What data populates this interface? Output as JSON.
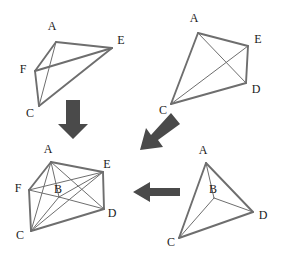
{
  "figure": {
    "line_color": "#6e6e6e",
    "arrow_color": "#4a4a4a",
    "label_color": "#1a1a1a",
    "background_color": "#ffffff"
  },
  "panels": [
    {
      "id": "top-left",
      "name": "upper-left-polyhedron",
      "vertices": [
        {
          "label": "A",
          "x": 56,
          "y": 42,
          "lx": 52,
          "ly": 27
        },
        {
          "label": "E",
          "x": 112,
          "y": 48,
          "lx": 121,
          "ly": 41
        },
        {
          "label": "F",
          "x": 35,
          "y": 71,
          "lx": 23,
          "ly": 70
        },
        {
          "label": "C",
          "x": 39,
          "y": 106,
          "lx": 30,
          "ly": 114
        }
      ],
      "edges": [
        {
          "from": "A",
          "to": "E",
          "weight": "thick"
        },
        {
          "from": "A",
          "to": "F",
          "weight": "thick"
        },
        {
          "from": "A",
          "to": "C",
          "weight": "thin"
        },
        {
          "from": "F",
          "to": "C",
          "weight": "thick"
        },
        {
          "from": "F",
          "to": "E",
          "weight": "thick"
        },
        {
          "from": "C",
          "to": "E",
          "weight": "thick"
        },
        {
          "from": "A",
          "to": "D",
          "weight": "thin"
        }
      ]
    },
    {
      "id": "top-right",
      "name": "upper-right-polyhedron",
      "vertices": [
        {
          "label": "A",
          "x": 198,
          "y": 33,
          "lx": 194,
          "ly": 19
        },
        {
          "label": "E",
          "x": 248,
          "y": 46,
          "lx": 258,
          "ly": 40
        },
        {
          "label": "D",
          "x": 246,
          "y": 83,
          "lx": 256,
          "ly": 90
        },
        {
          "label": "C",
          "x": 171,
          "y": 104,
          "lx": 163,
          "ly": 111
        }
      ],
      "edges": [
        {
          "from": "A",
          "to": "E",
          "weight": "thick"
        },
        {
          "from": "A",
          "to": "C",
          "weight": "thick"
        },
        {
          "from": "A",
          "to": "D",
          "weight": "thin"
        },
        {
          "from": "E",
          "to": "D",
          "weight": "thick"
        },
        {
          "from": "E",
          "to": "C",
          "weight": "thin"
        },
        {
          "from": "C",
          "to": "D",
          "weight": "thick"
        }
      ]
    },
    {
      "id": "bottom-left",
      "name": "lower-left-polyhedron",
      "vertices": [
        {
          "label": "A",
          "x": 51,
          "y": 162,
          "lx": 48,
          "ly": 150
        },
        {
          "label": "E",
          "x": 103,
          "y": 172,
          "lx": 107,
          "ly": 165
        },
        {
          "label": "F",
          "x": 29,
          "y": 190,
          "lx": 18,
          "ly": 189
        },
        {
          "label": "B",
          "x": 59,
          "y": 197,
          "lx": 58,
          "ly": 190
        },
        {
          "label": "D",
          "x": 104,
          "y": 209,
          "lx": 112,
          "ly": 214
        },
        {
          "label": "C",
          "x": 31,
          "y": 231,
          "lx": 20,
          "ly": 236
        }
      ],
      "edges": [
        {
          "from": "A",
          "to": "E",
          "weight": "thick"
        },
        {
          "from": "A",
          "to": "F",
          "weight": "thick"
        },
        {
          "from": "A",
          "to": "B",
          "weight": "thin"
        },
        {
          "from": "A",
          "to": "C",
          "weight": "thin"
        },
        {
          "from": "A",
          "to": "D",
          "weight": "thin"
        },
        {
          "from": "F",
          "to": "C",
          "weight": "thick"
        },
        {
          "from": "F",
          "to": "B",
          "weight": "thin"
        },
        {
          "from": "F",
          "to": "E",
          "weight": "thin"
        },
        {
          "from": "B",
          "to": "E",
          "weight": "thin"
        },
        {
          "from": "B",
          "to": "D",
          "weight": "thin"
        },
        {
          "from": "B",
          "to": "C",
          "weight": "thin"
        },
        {
          "from": "E",
          "to": "D",
          "weight": "thick"
        },
        {
          "from": "E",
          "to": "C",
          "weight": "thin"
        },
        {
          "from": "C",
          "to": "D",
          "weight": "thick"
        }
      ]
    },
    {
      "id": "bottom-right",
      "name": "lower-right-polyhedron",
      "vertices": [
        {
          "label": "A",
          "x": 206,
          "y": 163,
          "lx": 203,
          "ly": 151
        },
        {
          "label": "B",
          "x": 214,
          "y": 198,
          "lx": 213,
          "ly": 190
        },
        {
          "label": "D",
          "x": 253,
          "y": 212,
          "lx": 263,
          "ly": 216
        },
        {
          "label": "C",
          "x": 179,
          "y": 238,
          "lx": 171,
          "ly": 243
        }
      ],
      "edges": [
        {
          "from": "A",
          "to": "B",
          "weight": "thin"
        },
        {
          "from": "A",
          "to": "C",
          "weight": "thick"
        },
        {
          "from": "A",
          "to": "D",
          "weight": "thick"
        },
        {
          "from": "B",
          "to": "C",
          "weight": "thin"
        },
        {
          "from": "B",
          "to": "D",
          "weight": "thin"
        },
        {
          "from": "C",
          "to": "D",
          "weight": "thick"
        }
      ]
    }
  ],
  "arrows": [
    {
      "id": "arrow-down",
      "name": "arrow-down",
      "direction": "down",
      "points": "66,100 80,100 80,124 88,124 73,139 58,124 66,124"
    },
    {
      "id": "arrow-diagonal",
      "name": "arrow-diagonal-down-left",
      "direction": "down-left",
      "points": "171,113 180,124 158,140 163,147 140,150 146,128 151,135"
    },
    {
      "id": "arrow-left",
      "name": "arrow-left",
      "direction": "left",
      "points": "133,192 150,182 150,188 180,188 180,196 150,196 150,202"
    }
  ]
}
